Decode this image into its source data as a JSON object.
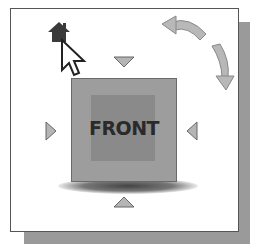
{
  "viewcube": {
    "face_label": "FRONT",
    "icons": {
      "home": "home-icon",
      "cursor": "arrow-cursor-icon",
      "rotate_ccw": "rotate-counterclockwise-arrow-icon",
      "rotate_cw": "rotate-clockwise-arrow-icon",
      "arrow_up": "triangle-down-icon",
      "arrow_down": "triangle-up-icon",
      "arrow_left": "triangle-right-icon",
      "arrow_right": "triangle-left-icon"
    },
    "colors": {
      "cube_face": "#9d9d9d",
      "cube_inner": "#8a8a8a",
      "arrows": "#b5b5b5",
      "home": "#333333"
    }
  }
}
